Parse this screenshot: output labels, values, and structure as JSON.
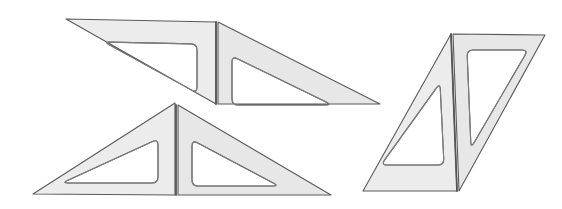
{
  "scene": {
    "title": "Drafting set squares illustration",
    "width": 562,
    "height": 209,
    "background_color": "#ffffff",
    "object_count": 3,
    "object_kind": "set-square-pair",
    "description": "Three pairs of right-triangle drafting set squares with triangular cut-outs, each pair hinged along a shared straight edge"
  },
  "style": {
    "fill_color": "#e9e9e9",
    "fill_color_light": "#f1f1f1",
    "fill_color_dark": "#e0e0e0",
    "stroke_color": "#5a5a5a",
    "stroke_color_soft": "#7d7d7d",
    "hinge_color": "#555555",
    "cutout_fill": "#ffffff",
    "stroke_width": 1.1,
    "hinge_stroke_width": 1.8,
    "cutout_corner_radius": 6
  },
  "objects": [
    {
      "id": "set-square-pair-top",
      "name": "Upper hinged set-square pair",
      "position": {
        "x": 66,
        "y": 19
      },
      "bounds": {
        "left": 66,
        "top": 19,
        "right": 380,
        "bottom": 104
      },
      "hinge": {
        "x1": 216,
        "y1": 22,
        "x2": 216,
        "y2": 104
      },
      "panels": [
        {
          "id": "top-left-panel",
          "name": "Upper left triangle",
          "outline": "66,19 216,22 216,104",
          "cutout": "104,42 197,44 197,93",
          "shade": "#ececec"
        },
        {
          "id": "top-right-panel",
          "name": "Upper right triangle",
          "outline": "218,22 380,104 218,104",
          "cutout": "232,56 332,105 232,105",
          "shade": "#e7e7e7"
        }
      ]
    },
    {
      "id": "set-square-pair-bottom-left",
      "name": "Lower hinged set-square pair",
      "position": {
        "x": 33,
        "y": 103
      },
      "bounds": {
        "left": 33,
        "top": 103,
        "right": 331,
        "bottom": 195
      },
      "hinge": {
        "x1": 176,
        "y1": 105,
        "x2": 176,
        "y2": 195
      },
      "panels": [
        {
          "id": "bottom-left-panel",
          "name": "Lower left triangle",
          "outline": "175,103 175,195 33,194",
          "cutout": "158,139 158,183 62,183",
          "shade": "#ececec"
        },
        {
          "id": "bottom-right-panel",
          "name": "Lower right triangle",
          "outline": "178,105 331,195 178,195",
          "cutout": "192,140 279,186 192,186",
          "shade": "#e7e7e7"
        }
      ]
    },
    {
      "id": "set-square-pair-right",
      "name": "Right-hand hinged set-square pair, rotated upright",
      "position": {
        "x": 363,
        "y": 33
      },
      "bounds": {
        "left": 363,
        "top": 33,
        "right": 545,
        "bottom": 192
      },
      "hinge": {
        "x1": 451,
        "y1": 34,
        "x2": 457,
        "y2": 191
      },
      "panels": [
        {
          "id": "right-near-panel",
          "name": "Right pair near triangle",
          "outline": "451,34 457,191 363,191",
          "cutout": "440,83 444,165 381,165",
          "shade": "#ececec"
        },
        {
          "id": "right-far-panel",
          "name": "Right pair far triangle",
          "outline": "453,34 545,35 459,191",
          "cutout": "467,50 528,50 471,148",
          "shade": "#e7e7e7"
        }
      ]
    }
  ]
}
